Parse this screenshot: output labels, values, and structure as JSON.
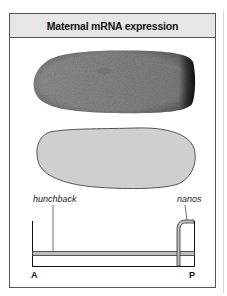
{
  "figure": {
    "title": "Maternal mRNA expression",
    "panels": [
      {
        "name": "embryo-photo",
        "description": "In situ stained embryo, dark staining at posterior pole"
      },
      {
        "name": "embryo-outline",
        "description": "Schematic embryo outline"
      }
    ],
    "graph": {
      "curves": [
        {
          "label": "hunchback",
          "shape": "uniform low level along A-P axis"
        },
        {
          "label": "nanos",
          "shape": "high at posterior pole only"
        }
      ],
      "axis": {
        "left_label": "A",
        "right_label": "P"
      }
    },
    "colors": {
      "header_bg": "#e6e6e6",
      "frame": "#555555",
      "embryo_photo": "#8a8a8a",
      "embryo_outline_fill": "#cfcfcf",
      "curve_fill": "#bdbdbd"
    }
  }
}
